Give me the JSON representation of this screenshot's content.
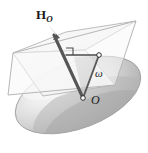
{
  "figure": {
    "type": "mechanics-vector-diagram",
    "background_color": "#ffffff",
    "labels": {
      "angular_momentum": {
        "symbol": "H",
        "subscript": "O",
        "text": "H",
        "role": "angular momentum vector about O"
      },
      "angular_velocity": {
        "symbol": "ω",
        "text": "ω",
        "role": "angular velocity vector"
      },
      "origin_point": {
        "symbol": "O",
        "text": "O",
        "role": "reference point / body fixed origin"
      }
    },
    "elements": {
      "body": {
        "name": "ellipsoid",
        "shape": "ellipsoid",
        "fill_light": "#f2f2f2",
        "fill_mid": "#c9c9c9",
        "fill_dark": "#a7a7a7",
        "outline_color": "#8f8f8f"
      },
      "plane": {
        "name": "reference-plane",
        "shape": "parallelogram",
        "fill": "#f6f6f6",
        "outline_color": "#b0b0b0"
      },
      "vector_H": {
        "name": "H-vector-arrow",
        "color": "#565656",
        "has_arrowhead": true
      },
      "vector_omega": {
        "name": "omega-vector-line",
        "color": "#565656",
        "has_arrowhead": false
      },
      "projection_line": {
        "name": "projection-line",
        "color": "#4a4a4a"
      },
      "right_angle_marker": {
        "name": "right-angle-marker",
        "color": "#4a4a4a",
        "indicates": "perpendicular"
      },
      "point_O": {
        "name": "origin-dot",
        "fill": "#ffffff",
        "stroke": "#333333"
      },
      "point_tip": {
        "name": "projection-endpoint-dot",
        "fill": "#ffffff",
        "stroke": "#333333"
      },
      "shaded_triangle": {
        "name": "shaded-triangle",
        "fill": "#cfcfcf"
      }
    }
  }
}
